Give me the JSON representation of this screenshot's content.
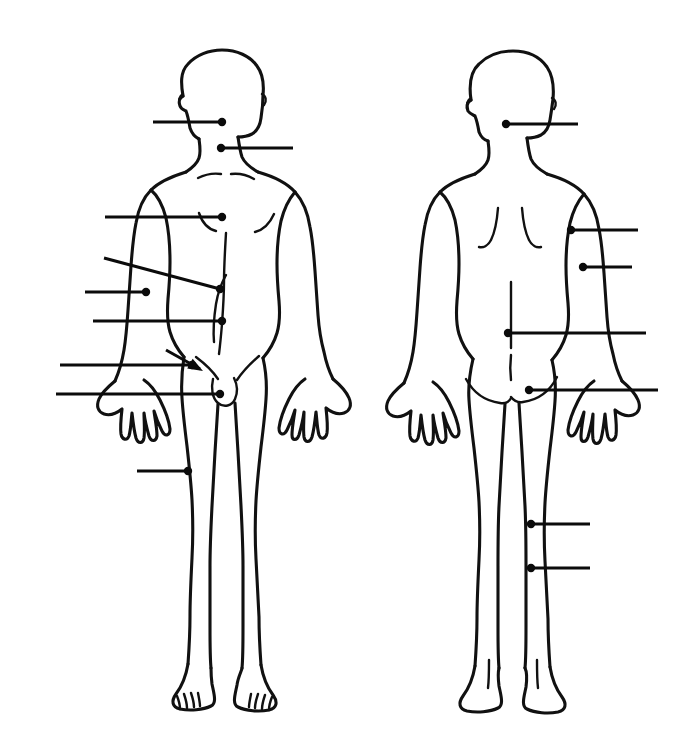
{
  "document": {
    "title": "Human Body Diagram — Anterior and Posterior Views",
    "background_color": "#ffffff",
    "ink_color": "#111111",
    "width": 687,
    "height": 747
  },
  "figures": [
    {
      "id": "anterior-figure",
      "view_label": "Anterior (front) view",
      "position": "left",
      "leaders": [
        {
          "id": "leader-face",
          "target_label": "face",
          "side": "left",
          "style": "horizontal",
          "x1": 153,
          "y1": 122,
          "x2": 222,
          "y2": 122,
          "dot_x": 222,
          "dot_y": 122
        },
        {
          "id": "leader-neck",
          "target_label": "neck",
          "side": "right",
          "style": "horizontal",
          "x1": 221,
          "y1": 148,
          "x2": 293,
          "y2": 148,
          "dot_x": 221,
          "dot_y": 148
        },
        {
          "id": "leader-chest",
          "target_label": "chest",
          "side": "left",
          "style": "horizontal",
          "x1": 105,
          "y1": 217,
          "x2": 222,
          "y2": 217,
          "dot_x": 222,
          "dot_y": 217
        },
        {
          "id": "leader-abdomen",
          "target_label": "abdomen",
          "side": "left",
          "style": "slanted",
          "x1": 104,
          "y1": 258,
          "x2": 220,
          "y2": 289,
          "dot_x": 220,
          "dot_y": 289
        },
        {
          "id": "leader-elbow",
          "target_label": "elbow",
          "side": "left",
          "style": "horizontal",
          "x1": 85,
          "y1": 292,
          "x2": 146,
          "y2": 292,
          "dot_x": 146,
          "dot_y": 292
        },
        {
          "id": "leader-waist",
          "target_label": "waist",
          "side": "left",
          "style": "horizontal",
          "x1": 93,
          "y1": 321,
          "x2": 222,
          "y2": 321,
          "dot_x": 222,
          "dot_y": 321
        },
        {
          "id": "leader-groin",
          "target_label": "groin",
          "side": "left",
          "style": "arrow",
          "x1": 166,
          "y1": 350,
          "x2": 203,
          "y2": 371,
          "dot_x": 203,
          "dot_y": 371
        },
        {
          "id": "leader-hand-front",
          "target_label": "hand",
          "side": "left",
          "style": "horizontal",
          "x1": 60,
          "y1": 365,
          "x2": 192,
          "y2": 365,
          "dot_x": 192,
          "dot_y": 365
        },
        {
          "id": "leader-pubis",
          "target_label": "pubic region",
          "side": "left",
          "style": "horizontal",
          "x1": 56,
          "y1": 394,
          "x2": 220,
          "y2": 394,
          "dot_x": 220,
          "dot_y": 394
        },
        {
          "id": "leader-thigh",
          "target_label": "thigh",
          "side": "left",
          "style": "horizontal",
          "x1": 137,
          "y1": 471,
          "x2": 188,
          "y2": 471,
          "dot_x": 188,
          "dot_y": 471
        }
      ]
    },
    {
      "id": "posterior-figure",
      "view_label": "Posterior (back) view",
      "position": "right",
      "leaders": [
        {
          "id": "leader-back-head",
          "target_label": "back of head",
          "side": "right",
          "style": "horizontal",
          "x1": 506,
          "y1": 124,
          "x2": 578,
          "y2": 124,
          "dot_x": 506,
          "dot_y": 124
        },
        {
          "id": "leader-upper-arm",
          "target_label": "upper arm",
          "side": "right",
          "style": "horizontal",
          "x1": 571,
          "y1": 230,
          "x2": 638,
          "y2": 230,
          "dot_x": 571,
          "dot_y": 230
        },
        {
          "id": "leader-forearm",
          "target_label": "forearm",
          "side": "right",
          "style": "horizontal",
          "x1": 583,
          "y1": 267,
          "x2": 632,
          "y2": 267,
          "dot_x": 583,
          "dot_y": 267
        },
        {
          "id": "leader-lower-back",
          "target_label": "lower back",
          "side": "right",
          "style": "horizontal",
          "x1": 508,
          "y1": 333,
          "x2": 646,
          "y2": 333,
          "dot_x": 508,
          "dot_y": 333
        },
        {
          "id": "leader-buttock",
          "target_label": "buttock",
          "side": "right",
          "style": "horizontal",
          "x1": 529,
          "y1": 390,
          "x2": 658,
          "y2": 390,
          "dot_x": 529,
          "dot_y": 390
        },
        {
          "id": "leader-knee-back",
          "target_label": "back of knee",
          "side": "right",
          "style": "horizontal",
          "x1": 531,
          "y1": 524,
          "x2": 590,
          "y2": 524,
          "dot_x": 531,
          "dot_y": 524
        },
        {
          "id": "leader-calf",
          "target_label": "calf",
          "side": "right",
          "style": "horizontal",
          "x1": 531,
          "y1": 568,
          "x2": 590,
          "y2": 568,
          "dot_x": 531,
          "dot_y": 568
        }
      ]
    }
  ],
  "labels": {
    "visible_text": [],
    "note": "No printed label text appears in the image; leader lines terminate blank for the reader to fill in."
  }
}
